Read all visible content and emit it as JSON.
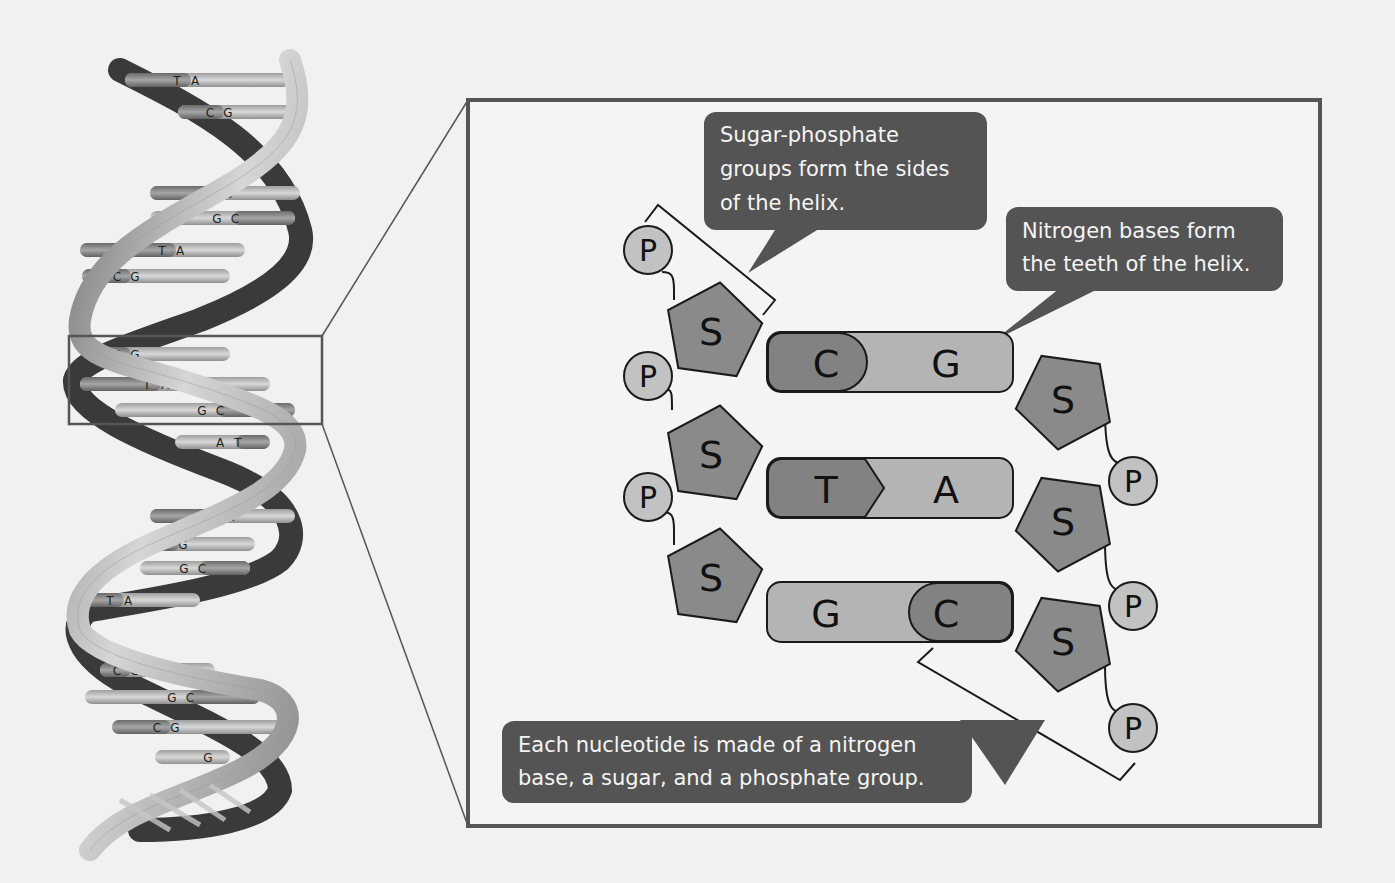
{
  "figure": {
    "colors": {
      "background": "#f1f1f0",
      "frame": "#555555",
      "callout_bg": "#545454",
      "callout_text": "#f4f4f4",
      "sugar_fill": "#8a8a8a",
      "phosphate_fill": "#c2c2c2",
      "base_dark": "#828282",
      "base_light": "#b4b4b4",
      "ribbon_light": "#c8c8c8",
      "ribbon_dark": "#3a3a3a"
    }
  },
  "helix": {
    "label": "double helix",
    "base_pairs": [
      {
        "left": "T",
        "right": "A"
      },
      {
        "left": "C",
        "right": "G"
      },
      {
        "left": "C",
        "right": "G"
      },
      {
        "left": "G",
        "right": "C"
      },
      {
        "left": "T",
        "right": "A"
      },
      {
        "left": "C",
        "right": "G"
      },
      {
        "left": "C",
        "right": "G"
      },
      {
        "left": "T",
        "right": "A"
      },
      {
        "left": "G",
        "right": "C"
      },
      {
        "left": "A",
        "right": "T"
      },
      {
        "left": "T",
        "right": "A"
      },
      {
        "left": "C",
        "right": "G"
      },
      {
        "left": "G",
        "right": "C"
      },
      {
        "left": "T",
        "right": "A"
      },
      {
        "left": "C",
        "right": "G"
      },
      {
        "left": "G",
        "right": "C"
      },
      {
        "left": "C",
        "right": "G"
      },
      {
        "left": "",
        "right": "G"
      }
    ]
  },
  "detail": {
    "phosphate_label": "P",
    "sugar_label": "S",
    "rungs": [
      {
        "left": "C",
        "right": "G"
      },
      {
        "left": "T",
        "right": "A"
      },
      {
        "left": "G",
        "right": "C"
      }
    ]
  },
  "callouts": {
    "sugar_phosphate": [
      "Sugar-phosphate",
      "groups form the sides",
      "of the helix."
    ],
    "nitrogen_bases": [
      "Nitrogen bases form",
      "the teeth of the helix."
    ],
    "nucleotide": [
      "Each nucleotide is made of a nitrogen",
      "base, a sugar, and a phosphate group."
    ]
  }
}
